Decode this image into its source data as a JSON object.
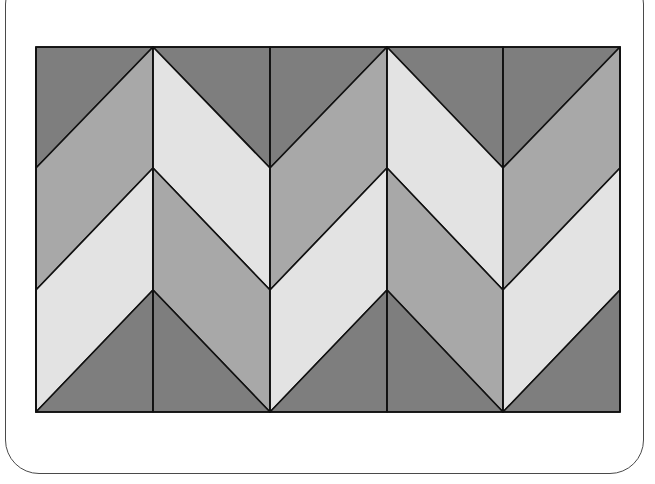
{
  "figure": {
    "grid": {
      "x_lines": [
        36,
        153,
        270,
        387,
        503,
        620
      ],
      "y_levels": [
        47,
        168,
        290,
        412
      ],
      "columns": 5
    },
    "colors": {
      "dark": "#7e7e7e",
      "medium": "#a8a8a8",
      "light": "#e3e3e3",
      "stroke": "#111111",
      "frame": "#4a4a4a",
      "background": "#ffffff"
    },
    "columns": [
      {
        "index": 0,
        "direction": "up",
        "upper_band": "medium",
        "lower_band": "light"
      },
      {
        "index": 1,
        "direction": "down",
        "upper_band": "light",
        "lower_band": "medium"
      },
      {
        "index": 2,
        "direction": "up",
        "upper_band": "medium",
        "lower_band": "light"
      },
      {
        "index": 3,
        "direction": "down",
        "upper_band": "light",
        "lower_band": "medium"
      },
      {
        "index": 4,
        "direction": "up",
        "upper_band": "medium",
        "lower_band": "light"
      }
    ]
  }
}
